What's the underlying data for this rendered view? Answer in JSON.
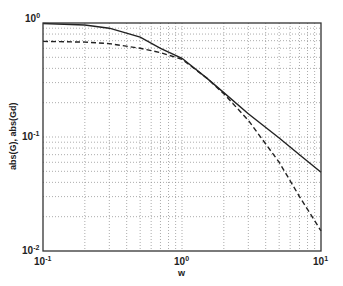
{
  "chart_data": {
    "type": "line",
    "title": "",
    "xlabel": "w",
    "ylabel": "abs(G), abs(Gd)",
    "xscale": "log",
    "yscale": "log",
    "xlim": [
      0.1,
      10
    ],
    "ylim": [
      0.01,
      1
    ],
    "grid": true,
    "x_ticks": [
      "10^-1",
      "10^0",
      "10^1"
    ],
    "y_ticks": [
      "10^0",
      "10^-1",
      "10^-2"
    ],
    "x": [
      0.1,
      0.2,
      0.3,
      0.5,
      0.7,
      1.0,
      1.5,
      2.0,
      3.0,
      5.0,
      7.0,
      10.0
    ],
    "series": [
      {
        "name": "abs(G)",
        "style": "solid",
        "values": [
          0.99,
          0.96,
          0.9,
          0.75,
          0.6,
          0.49,
          0.33,
          0.245,
          0.16,
          0.098,
          0.07,
          0.049
        ]
      },
      {
        "name": "abs(Gd)",
        "style": "dashed",
        "values": [
          0.69,
          0.68,
          0.66,
          0.6,
          0.55,
          0.48,
          0.33,
          0.24,
          0.14,
          0.06,
          0.03,
          0.015
        ]
      }
    ]
  },
  "labels": {
    "x_tick_left_base": "10",
    "x_tick_left_exp": "-1",
    "x_tick_mid_base": "10",
    "x_tick_mid_exp": "0",
    "x_tick_right_base": "10",
    "x_tick_right_exp": "1",
    "y_tick_top_base": "10",
    "y_tick_top_exp": "0",
    "y_tick_mid_base": "10",
    "y_tick_mid_exp": "-1",
    "y_tick_bot_base": "10",
    "y_tick_bot_exp": "-2",
    "xlabel": "w",
    "ylabel": "abs(G), abs(Gd)"
  }
}
